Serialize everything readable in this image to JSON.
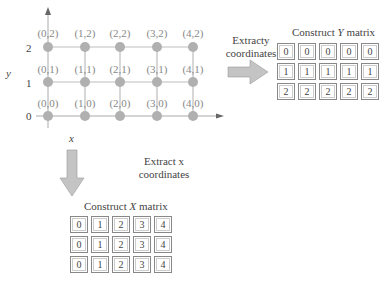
{
  "grid": {
    "points": [
      [
        "(0,0)",
        "(1,0)",
        "(2,0)",
        "(3,0)",
        "(4,0)"
      ],
      [
        "(0,1)",
        "(1,1)",
        "(2,1)",
        "(3,1)",
        "(4,1)"
      ],
      [
        "(0,2)",
        "(1,2)",
        "(2,2)",
        "(3,2)",
        "(4,2)"
      ]
    ],
    "y_ticks": [
      "0",
      "1",
      "2"
    ],
    "x_axis_label": "x",
    "y_axis_label": "y",
    "point_color": "#b0b0b0",
    "line_color": "#bdbdbd"
  },
  "y_branch": {
    "caption_line1": "Extracty",
    "caption_line2": "coordinates",
    "title_prefix": "Construct ",
    "title_var": "Y",
    "title_suffix": " matrix",
    "matrix": [
      [
        "0",
        "0",
        "0",
        "0",
        "0"
      ],
      [
        "1",
        "1",
        "1",
        "1",
        "1"
      ],
      [
        "2",
        "2",
        "2",
        "2",
        "2"
      ]
    ]
  },
  "x_branch": {
    "caption_line1": "Extract x",
    "caption_line2": "coordinates",
    "title_prefix": "Construct ",
    "title_var": "X",
    "title_suffix": " matrix",
    "matrix": [
      [
        "0",
        "1",
        "2",
        "3",
        "4"
      ],
      [
        "0",
        "1",
        "2",
        "3",
        "4"
      ],
      [
        "0",
        "1",
        "2",
        "3",
        "4"
      ]
    ]
  },
  "arrow_color": "#c4c4c4"
}
